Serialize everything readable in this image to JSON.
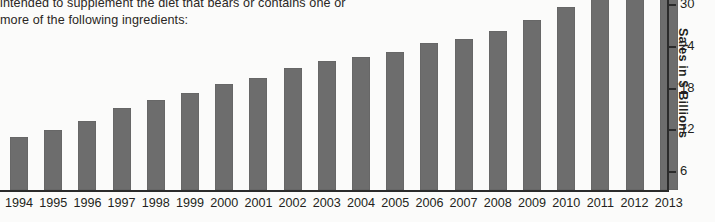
{
  "document": {
    "line1": "intended to supplement the diet that bears or contains one or",
    "line2": "more of the following ingredients:"
  },
  "chart_data": {
    "type": "bar",
    "title": "",
    "xlabel": "",
    "ylabel": "Sales in $ Billions",
    "ylim": [
      0,
      33
    ],
    "grid": false,
    "legend": null,
    "bar_color": "#6d6d6d",
    "yticks": [
      6,
      12,
      18,
      24,
      30
    ],
    "ytick_labels": [
      "6",
      "12",
      "18",
      "24",
      "30"
    ],
    "categories": [
      "1994",
      "1995",
      "1996",
      "1997",
      "1998",
      "1999",
      "2000",
      "2001",
      "2002",
      "2003",
      "2004",
      "2005",
      "2006",
      "2007",
      "2008",
      "2009",
      "2010",
      "2011",
      "2012",
      "2013"
    ],
    "values": [
      11.0,
      12.0,
      13.3,
      15.2,
      16.4,
      17.4,
      18.6,
      19.5,
      21.0,
      21.9,
      22.5,
      23.3,
      24.5,
      25.2,
      26.3,
      27.9,
      29.8,
      31.2,
      32.8,
      33.2
    ],
    "series": [
      {
        "name": "Sales in $ Billions",
        "values": [
          11.0,
          12.0,
          13.3,
          15.2,
          16.4,
          17.4,
          18.6,
          19.5,
          21.0,
          21.9,
          22.5,
          23.3,
          24.5,
          25.2,
          26.3,
          27.9,
          29.8,
          31.2,
          32.8,
          33.2
        ]
      }
    ],
    "note_top_bars_clipped": "2012 and 2013 bars extend above the top edge of the image"
  }
}
